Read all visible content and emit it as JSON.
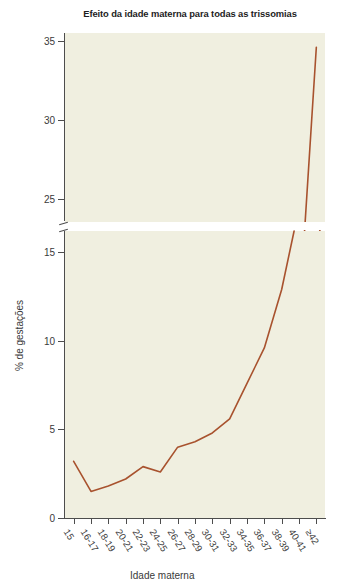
{
  "chart_data": {
    "type": "line",
    "title": "Efeito da idade materna para todas as trissomias",
    "xlabel": "Idade materna",
    "ylabel": "% de gestações",
    "categories": [
      "15",
      "16-17",
      "18-19",
      "20-21",
      "22-23",
      "24-25",
      "26-27",
      "28-29",
      "30-31",
      "32-33",
      "34-35",
      "36-37",
      "38-39",
      "40-41",
      "≥42"
    ],
    "values": [
      3.2,
      1.5,
      1.8,
      2.2,
      2.9,
      2.6,
      4.0,
      4.3,
      4.8,
      5.6,
      7.6,
      9.6,
      12.9,
      17.5,
      34.6
    ],
    "series": [
      {
        "name": "% de gestações com trissomia",
        "values": [
          3.2,
          1.5,
          1.8,
          2.2,
          2.9,
          2.6,
          4.0,
          4.3,
          4.8,
          5.6,
          7.6,
          9.6,
          12.9,
          17.5,
          34.6
        ],
        "color": "#a8522e"
      }
    ],
    "broken_axis": true,
    "axis_segments": [
      {
        "name": "lower",
        "ylim": [
          0,
          16.2
        ],
        "ticks": [
          0,
          5,
          10,
          15
        ]
      },
      {
        "name": "upper",
        "ylim": [
          23.5,
          35.5
        ],
        "ticks": [
          25,
          30,
          35
        ]
      }
    ],
    "ytick_labels_lower": [
      "0",
      "5",
      "10",
      "15"
    ],
    "ytick_labels_upper": [
      "25",
      "30",
      "35"
    ],
    "grid": false,
    "legend": "none",
    "plot_background": "#f0efe0",
    "page_background": "#ffffff",
    "axis_color": "#4d4d4d"
  },
  "figure": {
    "title": "Efeito da idade materna para todas as trissomias",
    "ylabel": "% de gestações",
    "xlabel": "Idade materna"
  }
}
